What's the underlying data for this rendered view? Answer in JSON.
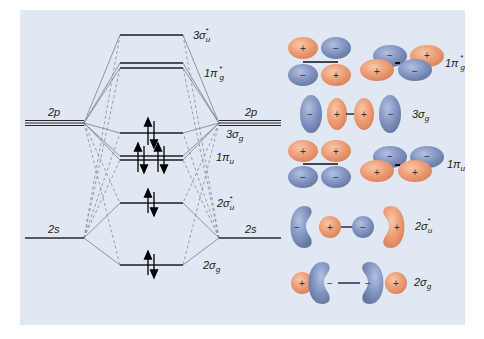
{
  "atomic_orbitals": {
    "left_2p": "2p",
    "right_2p": "2p",
    "left_2s": "2s",
    "right_2s": "2s"
  },
  "molecular_orbitals": [
    {
      "id": "3sigma_u_star",
      "label": "3σ",
      "sub": "u",
      "sup": "*",
      "electrons": 0,
      "degenerate": false
    },
    {
      "id": "1pi_g_star",
      "label": "1π",
      "sub": "g",
      "sup": "*",
      "electrons": 0,
      "degenerate": true
    },
    {
      "id": "3sigma_g",
      "label": "3σ",
      "sub": "g",
      "sup": "",
      "electrons": 2,
      "degenerate": false
    },
    {
      "id": "1pi_u",
      "label": "1π",
      "sub": "u",
      "sup": "",
      "electrons": 4,
      "degenerate": true
    },
    {
      "id": "2sigma_u_star",
      "label": "2σ",
      "sub": "u",
      "sup": "*",
      "electrons": 2,
      "degenerate": false
    },
    {
      "id": "2sigma_g",
      "label": "2σ",
      "sub": "g",
      "sup": "",
      "electrons": 2,
      "degenerate": false
    }
  ],
  "orbital_pictures": {
    "1pi_g_star": {
      "label": "1π",
      "sub": "g",
      "sup": "*",
      "signs": [
        "+",
        "−",
        "−",
        "+",
        "−",
        "+",
        "+",
        "−"
      ]
    },
    "3sigma_g": {
      "label": "3σ",
      "sub": "g",
      "signs": [
        "−",
        "+",
        "+",
        "−"
      ]
    },
    "1pi_u": {
      "label": "1π",
      "sub": "u",
      "signs": [
        "+",
        "+",
        "−",
        "−",
        "−",
        "−",
        "+",
        "+"
      ]
    },
    "2sigma_u_star": {
      "label": "2σ",
      "sub": "u",
      "sup": "*",
      "signs": [
        "−",
        "+",
        "−",
        "+"
      ]
    },
    "2sigma_g": {
      "label": "2σ",
      "sub": "g",
      "signs": [
        "+",
        "−",
        "−",
        "+"
      ]
    }
  },
  "colors": {
    "background_panel": "#e0e8f3",
    "positive_lobe": "#ec9a74",
    "negative_lobe": "#7d8fbd",
    "level_line": "#222222",
    "correlation_line": "#888888"
  }
}
